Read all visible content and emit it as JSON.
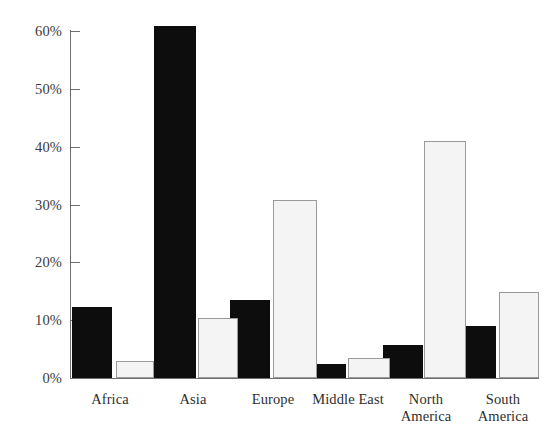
{
  "chart_data": {
    "type": "bar",
    "title": "",
    "xlabel": "",
    "ylabel": "",
    "categories": [
      "Africa",
      "Asia",
      "Europe",
      "Middle East",
      "North America",
      "South America"
    ],
    "series": [
      {
        "name": "Series 1",
        "color": "#0d0d0d",
        "values": [
          12.2,
          60.8,
          13.5,
          2.4,
          5.7,
          9.0
        ]
      },
      {
        "name": "Series 2",
        "color": "#f4f4f4",
        "values": [
          2.9,
          10.4,
          30.8,
          3.5,
          41.0,
          14.9
        ]
      }
    ],
    "ylim": [
      0,
      60
    ],
    "ytick_values": [
      0,
      10,
      20,
      30,
      40,
      50,
      60
    ],
    "ytick_labels": [
      "0%",
      "10%",
      "20%",
      "30%",
      "40%",
      "50%",
      "60%"
    ],
    "grid": false,
    "legend": "none",
    "axis_color": "#6f6f6f",
    "text_color": "#2e2e2e"
  },
  "axis": {
    "ticks": [
      {
        "label": "60%",
        "value": 60
      },
      {
        "label": "50%",
        "value": 50
      },
      {
        "label": "40%",
        "value": 40
      },
      {
        "label": "30%",
        "value": 30
      },
      {
        "label": "20%",
        "value": 20
      },
      {
        "label": "10%",
        "value": 10
      },
      {
        "label": "0%",
        "value": 0
      }
    ]
  },
  "categories": [
    {
      "label": "Africa",
      "line1": "Africa",
      "line2": ""
    },
    {
      "label": "Asia",
      "line1": "Asia",
      "line2": ""
    },
    {
      "label": "Europe",
      "line1": "Europe",
      "line2": ""
    },
    {
      "label": "Middle East",
      "line1": "Middle East",
      "line2": ""
    },
    {
      "label": "North America",
      "line1": "North",
      "line2": "America"
    },
    {
      "label": "South America",
      "line1": "South",
      "line2": "America"
    }
  ]
}
